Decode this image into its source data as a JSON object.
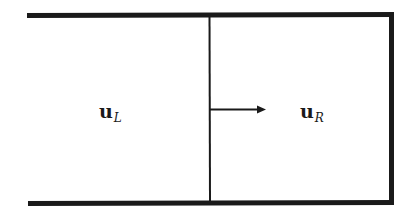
{
  "diagram": {
    "type": "riemann-problem-domain",
    "stroke_color": "#1a1a1a",
    "background": "#ffffff",
    "left_state": {
      "symbol": "u",
      "subscript": "L"
    },
    "right_state": {
      "symbol": "u",
      "subscript": "R"
    },
    "interface": {
      "arrow_direction": "right"
    }
  }
}
